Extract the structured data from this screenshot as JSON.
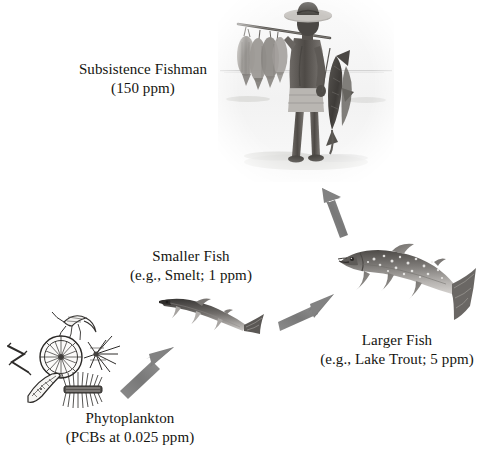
{
  "diagram": {
    "title_semantic": "biomagnification-food-chain",
    "background_color": "#ffffff",
    "arrow_color": "#7d7d7d",
    "text_color": "#14140f"
  },
  "nodes": [
    {
      "id": "phytoplankton",
      "line1": "Phytoplankton",
      "line2": "(PCBs at 0.025 ppm)",
      "organism": "phytoplankton-cluster",
      "concentration_ppm": 0.025,
      "trophic_level": 1
    },
    {
      "id": "smaller-fish",
      "line1": "Smaller Fish",
      "line2": "(e.g., Smelt; 1 ppm)",
      "organism": "smelt-fish",
      "concentration_ppm": 1,
      "trophic_level": 2
    },
    {
      "id": "larger-fish",
      "line1": "Larger Fish",
      "line2": "(e.g., Lake Trout; 5 ppm)",
      "organism": "lake-trout-fish",
      "concentration_ppm": 5,
      "trophic_level": 3
    },
    {
      "id": "subsistence-fishman",
      "line1": "Subsistence Fishman",
      "line2": "(150 ppm)",
      "organism": "fisherman-photo",
      "concentration_ppm": 150,
      "trophic_level": 4
    }
  ],
  "arrows": [
    {
      "id": "arrow-phytoplankton-to-smelt",
      "from": "phytoplankton",
      "to": "smaller-fish",
      "direction": "up-right"
    },
    {
      "id": "arrow-smelt-to-trout",
      "from": "smaller-fish",
      "to": "larger-fish",
      "direction": "up-right"
    },
    {
      "id": "arrow-trout-to-fishman",
      "from": "larger-fish",
      "to": "subsistence-fishman",
      "direction": "up"
    }
  ]
}
